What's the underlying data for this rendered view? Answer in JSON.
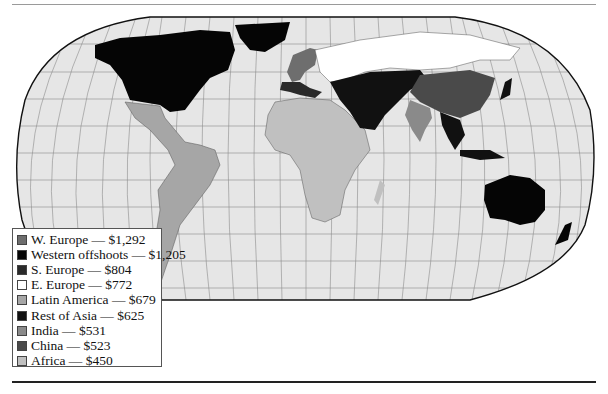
{
  "map": {
    "type": "choropleth",
    "projection": "Robinson-style world map",
    "colors": {
      "ocean": "#e6e6e6",
      "graticule": "#8c8c8c",
      "outline": "#111111"
    }
  },
  "legend": {
    "items": [
      {
        "label": "W. Europe — $1,292",
        "region": "W. Europe",
        "value": "$1,292",
        "color": "#6e6e6e"
      },
      {
        "label": "Western offshoots — $1,205",
        "region": "Western offshoots",
        "value": "$1,205",
        "color": "#050505"
      },
      {
        "label": "S. Europe — $804",
        "region": "S. Europe",
        "value": "$804",
        "color": "#2a2a2a"
      },
      {
        "label": "E. Europe — $772",
        "region": "E. Europe",
        "value": "$772",
        "color": "#ffffff"
      },
      {
        "label": "Latin America — $679",
        "region": "Latin America",
        "value": "$679",
        "color": "#a6a6a6"
      },
      {
        "label": "Rest of Asia — $625",
        "region": "Rest of Asia",
        "value": "$625",
        "color": "#111111"
      },
      {
        "label": "India — $531",
        "region": "India",
        "value": "$531",
        "color": "#8a8a8a"
      },
      {
        "label": "China — $523",
        "region": "China",
        "value": "$523",
        "color": "#4a4a4a"
      },
      {
        "label": "Africa — $450",
        "region": "Africa",
        "value": "$450",
        "color": "#c0c0c0"
      }
    ]
  }
}
